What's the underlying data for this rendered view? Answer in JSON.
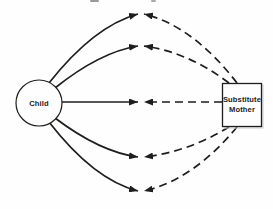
{
  "figure": {
    "nodes": {
      "child": {
        "label": "Child",
        "shape": "circle"
      },
      "substitute_mother": {
        "line1": "Substitute",
        "line2": "Mother",
        "shape": "rectangle"
      }
    },
    "edges": [
      {
        "id": 1,
        "position": "outer-top",
        "from_child_style": "solid",
        "from_mother_style": "dashed",
        "arrows": "meet-at-center"
      },
      {
        "id": 2,
        "position": "inner-top",
        "from_child_style": "solid",
        "from_mother_style": "dashed",
        "arrows": "meet-at-center"
      },
      {
        "id": 3,
        "position": "middle",
        "from_child_style": "solid",
        "from_mother_style": "dashed",
        "arrows": "meet-at-center"
      },
      {
        "id": 4,
        "position": "inner-bottom",
        "from_child_style": "solid",
        "from_mother_style": "dashed",
        "arrows": "meet-at-center"
      },
      {
        "id": 5,
        "position": "outer-bottom",
        "from_child_style": "solid",
        "from_mother_style": "dashed",
        "arrows": "meet-at-center"
      }
    ],
    "colors": {
      "ink": "#1d1d1b",
      "paper": "#fefefe",
      "shadow": "#c9c9c9"
    }
  }
}
